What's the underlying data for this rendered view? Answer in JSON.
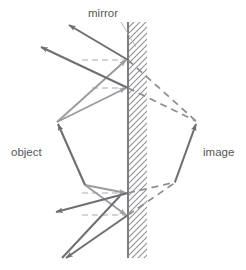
{
  "figure": {
    "background_color": "#ffffff",
    "width": 246,
    "height": 270,
    "labels": {
      "mirror": "mirror",
      "object": "object",
      "image": "image"
    },
    "colors": {
      "ray_solid": "#6e6f73",
      "ray_light": "#9b9ca0",
      "ray_dashed": "#8c8d91",
      "mirror_line": "#5d5e62",
      "hatch": "#8f9095",
      "normal_dashed": "#a9aaae",
      "label_text": "#55565a",
      "leader_line": "#b0b1b5"
    },
    "geometry": {
      "mirror": {
        "x": 128,
        "y_top": 22,
        "y_bottom": 258
      },
      "hatch_width": 18,
      "hit_points": [
        {
          "id": "hit-upper-outer",
          "x": 128,
          "y": 60
        },
        {
          "id": "hit-upper-inner",
          "x": 128,
          "y": 88
        },
        {
          "id": "hit-lower-inner",
          "x": 128,
          "y": 193
        },
        {
          "id": "hit-lower-outer",
          "x": 128,
          "y": 215
        }
      ],
      "object_arrow": {
        "tail_x": 85,
        "tail_y": 185,
        "head_x": 57,
        "head_y": 122
      },
      "image_arrow": {
        "tail_x": 175,
        "tail_y": 182,
        "head_x": 197,
        "head_y": 122
      },
      "normals": [
        {
          "y": 60,
          "x_from": 128,
          "x_to": 80
        },
        {
          "y": 88,
          "x_from": 128,
          "x_to": 88
        },
        {
          "y": 193,
          "x_from": 128,
          "x_to": 80
        },
        {
          "y": 215,
          "x_from": 128,
          "x_to": 78
        }
      ]
    },
    "label_positions": {
      "mirror": {
        "x": 88,
        "y": 17
      },
      "object": {
        "x": 11,
        "y": 155
      },
      "image": {
        "x": 203,
        "y": 155
      }
    },
    "leader": {
      "x1": 121,
      "y1": 21,
      "x2": 134,
      "y2": 45
    }
  }
}
